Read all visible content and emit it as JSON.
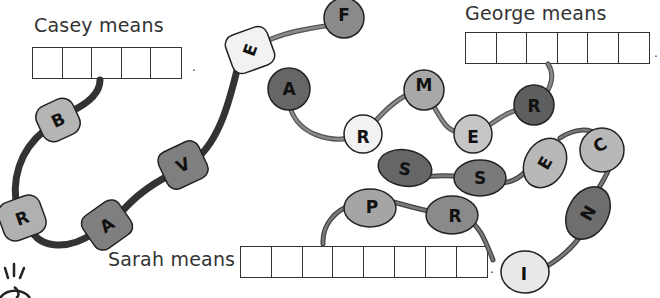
{
  "puzzles": [
    {
      "label": "Casey means",
      "box_count": 5,
      "punctuation": "."
    },
    {
      "label": "George means",
      "box_count": 6,
      "punctuation": "."
    },
    {
      "label": "Sarah means",
      "box_count": 8,
      "punctuation": "."
    }
  ],
  "beads": {
    "casey_chain": [
      "B",
      "R",
      "A",
      "V",
      "E"
    ],
    "george_chain": [
      "F",
      "A",
      "R",
      "M",
      "E",
      "R"
    ],
    "sarah_chain": [
      "P",
      "R",
      "I",
      "N",
      "C",
      "E",
      "S",
      "S"
    ]
  },
  "colors": {
    "light": "#d6d6d6",
    "mid": "#a9a9a9",
    "dark": "#7a7a7a",
    "darker": "#5e5e5e",
    "white": "#f2f2f2",
    "string_dark": "#3a3a3a",
    "string_mid": "#6a6a6a"
  }
}
